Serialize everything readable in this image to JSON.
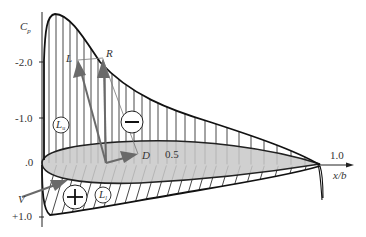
{
  "diagram": {
    "type": "airfoil pressure coefficient distribution",
    "y_axis": {
      "label": "C",
      "label_sub": "p",
      "ticks": [
        {
          "label": "-2.0",
          "value": -2.0
        },
        {
          "label": "-1.0",
          "value": -1.0
        },
        {
          "label": ".0",
          "value": 0.0
        },
        {
          "label": "+1.0",
          "value": 1.0
        }
      ]
    },
    "x_axis": {
      "label": "x/b",
      "ticks": [
        {
          "label": "0.5",
          "value": 0.5
        },
        {
          "label": "1.0",
          "value": 1.0
        }
      ]
    },
    "vectors": {
      "lift": "L",
      "resultant": "R",
      "drag": "D",
      "velocity": "V"
    },
    "regions": {
      "upper_label": "L",
      "upper_sub": "u",
      "lower_label": "L",
      "lower_sub": "l",
      "suction_sign": "−",
      "pressure_sign": "+"
    },
    "colors": {
      "airfoil_fill": "#c8c8c8",
      "lines": "#222222",
      "arrows": "#6a6a6a"
    }
  }
}
